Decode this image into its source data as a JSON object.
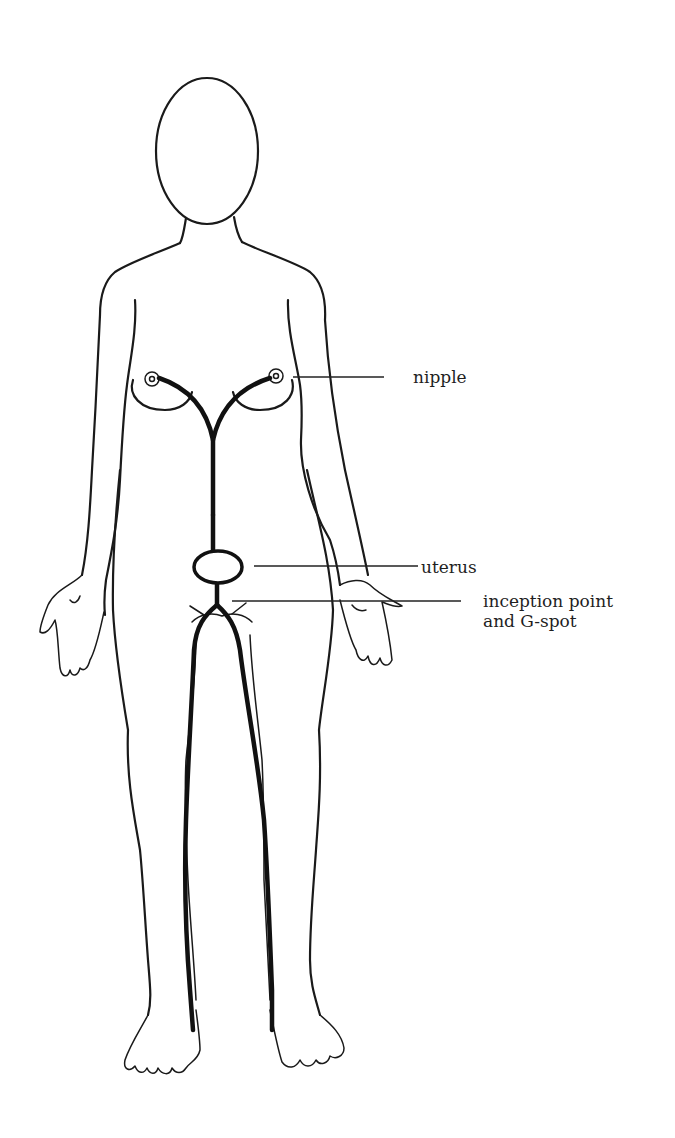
{
  "diagram": {
    "type": "anatomical line drawing",
    "labels": [
      {
        "id": "nipple",
        "text": "nipple"
      },
      {
        "id": "uterus",
        "text": "uterus"
      },
      {
        "id": "inception",
        "lines": [
          "inception point",
          "and G-spot"
        ]
      }
    ],
    "colors": {
      "background": "#ffffff",
      "ink": "#1a1a1a"
    }
  }
}
